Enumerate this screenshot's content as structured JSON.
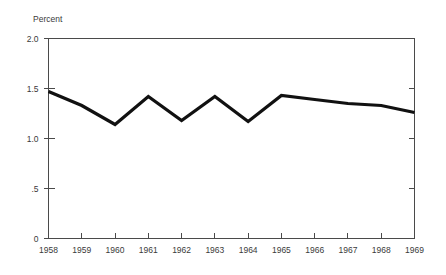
{
  "chart_data": {
    "type": "line",
    "title": "",
    "subtitle": "",
    "xlabel": "",
    "ylabel": "Percent",
    "categories": [
      "1958",
      "1959",
      "1960",
      "1961",
      "1962",
      "1963",
      "1964",
      "1965",
      "1966",
      "1967",
      "1968",
      "1969"
    ],
    "x": [
      1958,
      1959,
      1960,
      1961,
      1962,
      1963,
      1964,
      1965,
      1966,
      1967,
      1968,
      1969
    ],
    "values": [
      1.47,
      1.33,
      1.14,
      1.42,
      1.18,
      1.42,
      1.17,
      1.43,
      1.39,
      1.35,
      1.33,
      1.26
    ],
    "series": [
      {
        "name": "Percent",
        "values": [
          1.47,
          1.33,
          1.14,
          1.42,
          1.18,
          1.42,
          1.17,
          1.43,
          1.39,
          1.35,
          1.33,
          1.26
        ],
        "color": "#111111"
      }
    ],
    "ylim": [
      0,
      2.0
    ],
    "xlim": [
      1958,
      1969
    ],
    "y_ticks": [
      0,
      0.5,
      1.0,
      1.5,
      2.0
    ],
    "y_tick_labels": [
      "0",
      ".5",
      "1.0",
      "1.5",
      "2.0"
    ],
    "x_ticks": [
      1958,
      1959,
      1960,
      1961,
      1962,
      1963,
      1964,
      1965,
      1966,
      1967,
      1968,
      1969
    ],
    "x_tick_labels": [
      "1958",
      "1959",
      "1960",
      "1961",
      "1962",
      "1963",
      "1964",
      "1965",
      "1966",
      "1967",
      "1968",
      "1969"
    ],
    "grid": false,
    "legend": null,
    "legend_position": "none",
    "annotations": [],
    "axis_color": "#4a4a4a",
    "line_color": "#111111",
    "background_color": "#ffffff"
  },
  "figure": {
    "y_axis_title": "Percent"
  }
}
